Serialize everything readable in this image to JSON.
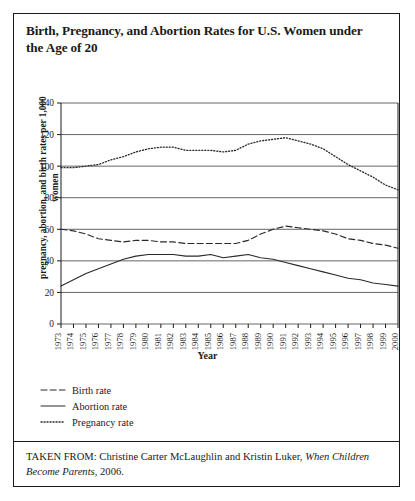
{
  "figure": {
    "title": "Birth, Pregnancy, and Abortion Rates for U.S. Women under the Age of 20",
    "source_prefix": "TAKEN FROM: Christine Carter McLaughlin and Kristin Luker, ",
    "source_italic": "When Children Become Parents",
    "source_suffix": ", 2006."
  },
  "legend": {
    "position": "below-plot",
    "items": [
      {
        "label": "Birth rate",
        "style": "dashed",
        "swatch": "dashed-line-swatch"
      },
      {
        "label": "Abortion rate",
        "style": "solid",
        "swatch": "solid-line-swatch"
      },
      {
        "label": "Pregnancy rate",
        "style": "dotted",
        "swatch": "dotted-line-swatch"
      }
    ]
  },
  "chart_data": {
    "type": "line",
    "title": "Birth, Pregnancy, and Abortion Rates for U.S. Women under the Age of 20",
    "xlabel": "Year",
    "ylabel": "pregnancy, abortion, and birth rates per 1,000 women",
    "ylim": [
      0,
      140
    ],
    "yticks": [
      0,
      20,
      40,
      60,
      80,
      100,
      120,
      140
    ],
    "grid": true,
    "x": [
      1973,
      1974,
      1975,
      1976,
      1977,
      1978,
      1979,
      1980,
      1981,
      1982,
      1983,
      1984,
      1985,
      1986,
      1987,
      1988,
      1989,
      1990,
      1991,
      1992,
      1993,
      1994,
      1995,
      1996,
      1997,
      1998,
      1999,
      2000
    ],
    "categories": [
      "1973",
      "1974",
      "1975",
      "1976",
      "1977",
      "1978",
      "1979",
      "1980",
      "1981",
      "1982",
      "1983",
      "1984",
      "1985",
      "1986",
      "1987",
      "1988",
      "1989",
      "1990",
      "1991",
      "1992",
      "1993",
      "1994",
      "1995",
      "1996",
      "1997",
      "1998",
      "1999",
      "2000"
    ],
    "series": [
      {
        "name": "Pregnancy rate",
        "style": "dotted",
        "values": [
          99,
          99,
          100,
          101,
          104,
          106,
          109,
          111,
          112,
          112,
          110,
          110,
          110,
          109,
          110,
          114,
          116,
          117,
          118,
          116,
          114,
          111,
          106,
          101,
          97,
          93,
          88,
          85
        ]
      },
      {
        "name": "Birth rate",
        "style": "dashed",
        "values": [
          60,
          59,
          57,
          54,
          53,
          52,
          53,
          53,
          52,
          52,
          51,
          51,
          51,
          51,
          51,
          53,
          57,
          60,
          62,
          61,
          60,
          59,
          57,
          54,
          53,
          51,
          50,
          48
        ]
      },
      {
        "name": "Abortion rate",
        "style": "solid",
        "values": [
          24,
          28,
          32,
          35,
          38,
          41,
          43,
          44,
          44,
          44,
          43,
          43,
          44,
          42,
          43,
          44,
          42,
          41,
          39,
          37,
          35,
          33,
          31,
          29,
          28,
          26,
          25,
          24
        ]
      }
    ]
  }
}
